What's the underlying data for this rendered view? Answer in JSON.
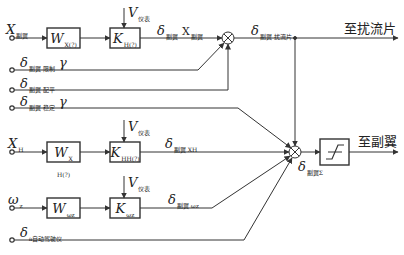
{
  "diagram": {
    "colors": {
      "line": "#333333",
      "text": "#222222",
      "background": "#ffffff"
    },
    "inputs": {
      "x_aileron": {
        "symbol": "X",
        "sub": "副翼"
      },
      "delta_limit": {
        "symbol": "δ",
        "sub": "副翼 限制",
        "suffix": "γ"
      },
      "delta_trim": {
        "symbol": "δ",
        "sub": "副翼 配平"
      },
      "delta_stab": {
        "symbol": "δ",
        "sub": "副翼 稳定",
        "suffix": "γ"
      },
      "x_h": {
        "symbol": "X",
        "sub": "H"
      },
      "omega_z": {
        "symbol": "ω",
        "sub": "z"
      },
      "delta_auto": {
        "symbol": "δ",
        "sub": "a自动驾驶仪"
      }
    },
    "blocks": {
      "w_row1": {
        "symbol": "W",
        "sub": "X(?)"
      },
      "k_row1": {
        "symbol": "K",
        "sub": "H(?)"
      },
      "w_row2": {
        "symbol": "W",
        "sub": "X H(?)"
      },
      "k_row2": {
        "symbol": "K",
        "sub": "HH(?)"
      },
      "w_row3": {
        "symbol": "W",
        "sub": "ωz"
      },
      "k_row3": {
        "symbol": "K",
        "sub": "ωz"
      },
      "limiter": {
        "name": "saturation-limiter"
      }
    },
    "gain_inputs": {
      "v_row1": {
        "symbol": "V",
        "sub": "仪表"
      },
      "v_row2": {
        "symbol": "V",
        "sub": "仪表"
      },
      "v_row3": {
        "symbol": "V",
        "sub": "仪表"
      }
    },
    "signals": {
      "delta_x": {
        "symbol": "δ",
        "sub": "副翼",
        "suffix": "X",
        "suffix_sub": "副翼"
      },
      "delta_spoiler": {
        "symbol": "δ",
        "sub": "副翼 扰流片"
      },
      "delta_xh": {
        "symbol": "δ",
        "sub": "副翼 XH"
      },
      "delta_omega": {
        "symbol": "δ",
        "sub": "副翼 ωz"
      },
      "delta_sum": {
        "symbol": "δ",
        "sub": "副翼Σ"
      }
    },
    "outputs": {
      "to_spoiler": "至扰流片",
      "to_aileron": "至副翼"
    }
  }
}
